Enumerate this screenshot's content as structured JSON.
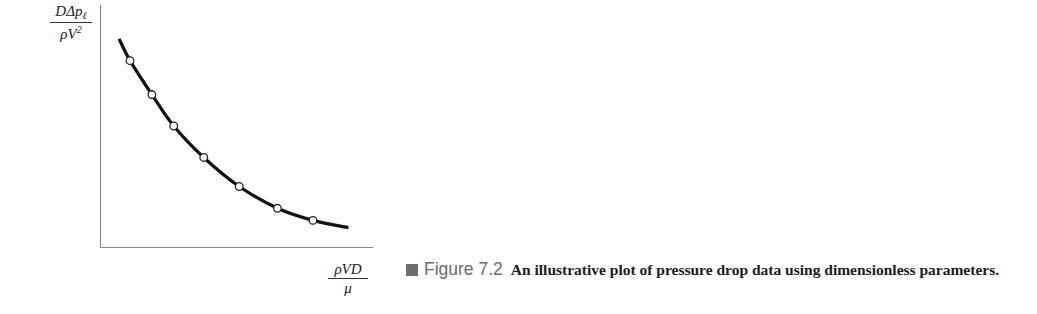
{
  "chart_data": {
    "type": "scatter",
    "title": "",
    "xlabel": "ρVD/μ",
    "ylabel": "DΔp_ℓ/ρV²",
    "xlabel_parts": {
      "numerator": "ρVD",
      "denominator": "μ"
    },
    "ylabel_parts": {
      "numerator_main": "DΔp",
      "numerator_sub": "ℓ",
      "denominator_main": "ρV",
      "denominator_sup": "2"
    },
    "x_ticks": [],
    "y_ticks": [],
    "grid": false,
    "legend": null,
    "axes_units": "arbitrary (no scale shown)",
    "series": [
      {
        "name": "data points",
        "marker": "open-circle",
        "x": [
          0.11,
          0.19,
          0.27,
          0.38,
          0.51,
          0.65,
          0.78
        ],
        "y": [
          0.77,
          0.63,
          0.5,
          0.37,
          0.25,
          0.16,
          0.11
        ]
      },
      {
        "name": "fitted curve",
        "style": "solid-thick",
        "x": [
          0.07,
          0.11,
          0.19,
          0.27,
          0.38,
          0.51,
          0.65,
          0.78,
          0.91
        ],
        "y": [
          0.86,
          0.77,
          0.63,
          0.5,
          0.37,
          0.25,
          0.16,
          0.11,
          0.08
        ]
      }
    ],
    "xlim": [
      0,
      1
    ],
    "ylim": [
      0,
      1
    ]
  },
  "caption": {
    "figure_label": "Figure 7.2",
    "text": "An illustrative plot of pressure drop data using dimensionless parameters."
  },
  "colors": {
    "curve": "#111111",
    "axis": "#888888",
    "marker_fill": "#ffffff",
    "bullet": "#6e6e6e",
    "figure_label": "#6a6a6a"
  }
}
